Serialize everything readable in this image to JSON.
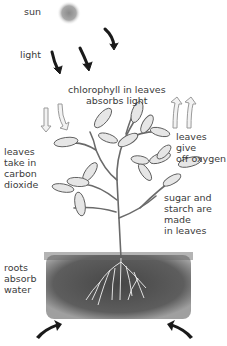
{
  "diagram": {
    "labels": {
      "sun": "sun",
      "light": "light",
      "chlorophyll": "chlorophyll in leaves\nabsorbs light",
      "carbon_dioxide": "leaves\ntake in\ncarbon\ndioxide",
      "oxygen": "leaves give\noff oxygen",
      "sugar": "sugar and\nstarch are\nmade\nin leaves",
      "roots": "roots\nabsorb\nwater"
    },
    "colors": {
      "text": "#3a3a3a",
      "soil": "#4a4a4a",
      "sun": "#9a9a9a",
      "arrow_dark": "#1a1a1a",
      "arrow_light": "#bdbdbd",
      "plant": "#6a6a6a"
    }
  }
}
